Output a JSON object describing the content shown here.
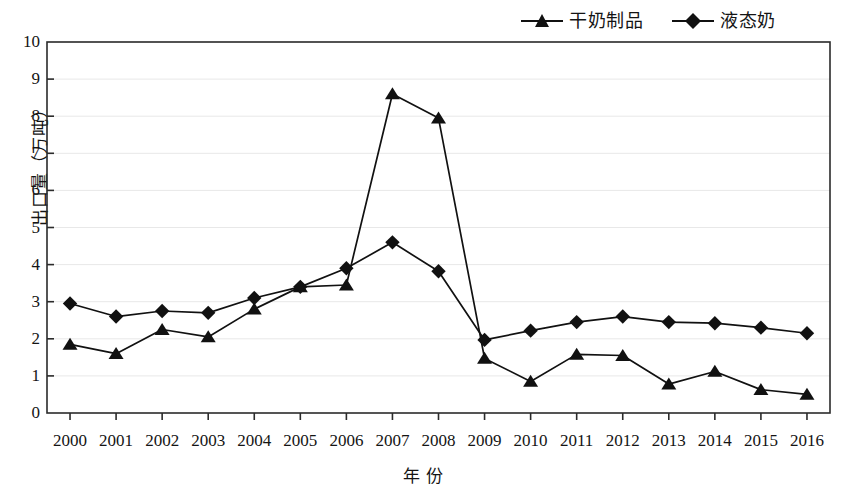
{
  "chart_data": {
    "type": "line",
    "title": "",
    "xlabel": "年  份",
    "ylabel": "出口量（万吨）",
    "ylim": [
      0,
      10
    ],
    "ytick_labels": [
      "0",
      "1",
      "2",
      "3",
      "4",
      "5",
      "6",
      "7",
      "8",
      "9",
      "10"
    ],
    "grid": true,
    "legend_position": "top-right",
    "categories": [
      "2000",
      "2001",
      "2002",
      "2003",
      "2004",
      "2005",
      "2006",
      "2007",
      "2008",
      "2009",
      "2010",
      "2011",
      "2012",
      "2013",
      "2014",
      "2015",
      "2016"
    ],
    "series": [
      {
        "name": "干奶制品",
        "marker": "triangle",
        "color": "#111111",
        "values": [
          1.85,
          1.6,
          2.25,
          2.05,
          2.8,
          3.4,
          3.45,
          8.6,
          7.95,
          1.47,
          0.85,
          1.58,
          1.55,
          0.78,
          1.12,
          0.63,
          0.5
        ]
      },
      {
        "name": "液态奶",
        "marker": "diamond",
        "color": "#111111",
        "values": [
          2.95,
          2.6,
          2.75,
          2.7,
          3.1,
          3.4,
          3.9,
          4.6,
          3.82,
          1.97,
          2.22,
          2.45,
          2.6,
          2.45,
          2.42,
          2.3,
          2.15
        ]
      }
    ]
  },
  "legend": {
    "items": [
      {
        "label": "干奶制品",
        "marker": "triangle"
      },
      {
        "label": "液态奶",
        "marker": "diamond"
      }
    ]
  }
}
